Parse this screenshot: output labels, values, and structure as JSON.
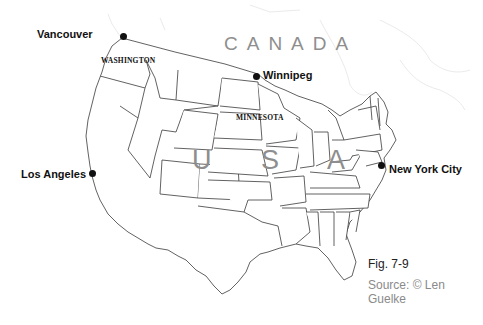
{
  "map": {
    "title": "Map of USA and southern Canada with selected cities",
    "colors": {
      "background": "#ffffff",
      "state_borders": "#3a3a3a",
      "country_label": "#8e8e8e",
      "city_label": "#111111",
      "source_text": "#8a8a8a"
    },
    "countries": [
      {
        "name": "CANADA"
      },
      {
        "name": "USA",
        "display": "U S A"
      }
    ],
    "states": [
      {
        "name": "WASHINGTON"
      },
      {
        "name": "MINNESOTA"
      }
    ],
    "cities": [
      {
        "name": "Vancouver",
        "marker": "dot"
      },
      {
        "name": "Winnipeg",
        "marker": "dot"
      },
      {
        "name": "Los Angeles",
        "marker": "dot"
      },
      {
        "name": "New York City",
        "marker": "dot"
      }
    ],
    "caption": {
      "figure": "Fig. 7-9",
      "source": "Source: © Len Guelke"
    }
  }
}
